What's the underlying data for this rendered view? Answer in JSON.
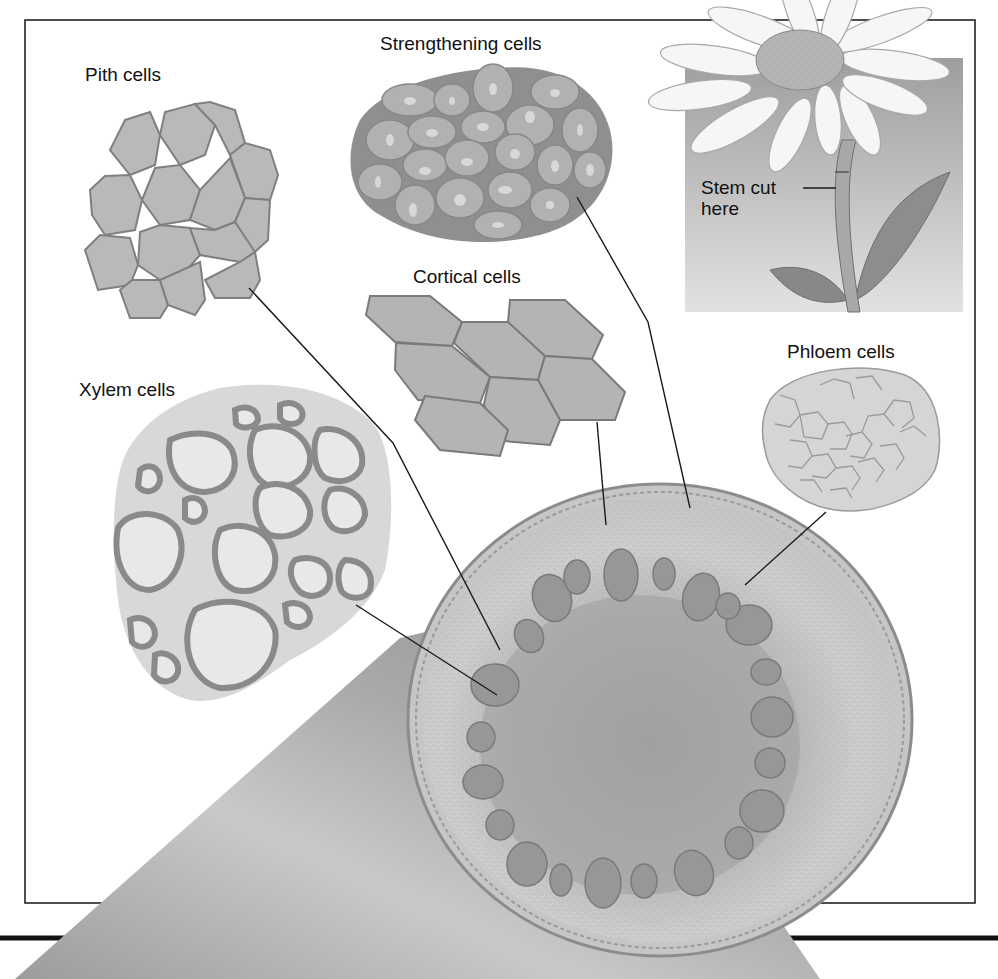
{
  "figure": {
    "labels": {
      "pith": "Pith cells",
      "strengthening": "Strengthening cells",
      "cortical": "Cortical cells",
      "phloem": "Phloem cells",
      "xylem": "Xylem cells",
      "stem_cut": "Stem cut\nhere"
    },
    "colors": {
      "cell_fill": "#b9b9b9",
      "cell_edge": "#7d7d7d",
      "light_cell_fill": "#d9d9d9",
      "stem_band": "#a8a8a8",
      "frame": "#222222",
      "leader_line": "#1a1a1a"
    }
  }
}
